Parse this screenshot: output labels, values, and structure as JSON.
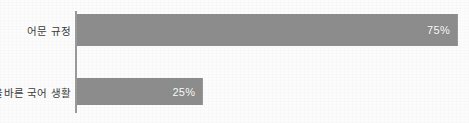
{
  "chart_data": {
    "type": "bar",
    "orientation": "horizontal",
    "title": "",
    "subtitle": "",
    "xlabel": "",
    "ylabel": "",
    "categories": [
      "어문 규정",
      "올바른 국어 생활"
    ],
    "values": [
      75,
      25
    ],
    "value_labels": [
      "75%",
      "25%"
    ],
    "xlim": [
      0,
      100
    ],
    "grid": false,
    "legend": false,
    "legend_position": "none",
    "bar_color": "#8c8c8c",
    "value_label_color": "#ffffff",
    "category_label_color": "#3b3b3b",
    "axis_color": "#9a9a9a",
    "background_color": "#fcfcfc"
  },
  "bars": [
    {
      "category": "어문 규정",
      "value": 75,
      "value_label": "75%",
      "width_pct": 100.0
    },
    {
      "category": "올바른 국어 생활",
      "value": 25,
      "value_label": "25%",
      "width_pct": 33.33
    }
  ]
}
